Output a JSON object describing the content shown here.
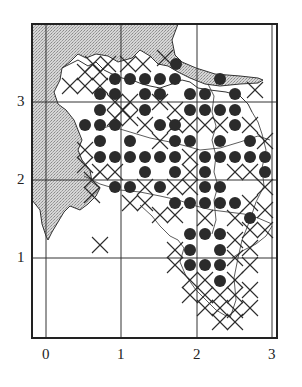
{
  "figure": {
    "type": "grid map with occurrence symbols",
    "x_axis": {
      "ticks": [
        "0",
        "1",
        "2",
        "3"
      ]
    },
    "y_axis": {
      "ticks": [
        "1",
        "2",
        "3"
      ]
    }
  },
  "legend_symbols": {
    "dot": "filled circle",
    "cross": "X mark",
    "shaded": "stippled grey area"
  },
  "colors": {
    "ink": "#2b2b2b",
    "shade": "#c8c8c8",
    "background": "#ffffff"
  },
  "dots": [
    [
      176,
      64
    ],
    [
      115,
      79
    ],
    [
      130,
      79
    ],
    [
      145,
      79
    ],
    [
      160,
      79
    ],
    [
      175,
      79
    ],
    [
      220,
      79
    ],
    [
      100,
      94
    ],
    [
      115,
      94
    ],
    [
      145,
      94
    ],
    [
      160,
      94
    ],
    [
      190,
      94
    ],
    [
      205,
      94
    ],
    [
      235,
      94
    ],
    [
      100,
      110
    ],
    [
      145,
      110
    ],
    [
      190,
      110
    ],
    [
      205,
      110
    ],
    [
      220,
      110
    ],
    [
      235,
      110
    ],
    [
      85,
      125
    ],
    [
      100,
      125
    ],
    [
      115,
      125
    ],
    [
      160,
      125
    ],
    [
      175,
      125
    ],
    [
      235,
      125
    ],
    [
      100,
      141
    ],
    [
      130,
      141
    ],
    [
      175,
      141
    ],
    [
      190,
      141
    ],
    [
      220,
      141
    ],
    [
      250,
      141
    ],
    [
      100,
      157
    ],
    [
      115,
      157
    ],
    [
      130,
      157
    ],
    [
      145,
      157
    ],
    [
      160,
      157
    ],
    [
      175,
      157
    ],
    [
      205,
      157
    ],
    [
      220,
      157
    ],
    [
      235,
      157
    ],
    [
      250,
      157
    ],
    [
      265,
      157
    ],
    [
      145,
      172
    ],
    [
      175,
      172
    ],
    [
      205,
      172
    ],
    [
      265,
      172
    ],
    [
      115,
      187
    ],
    [
      130,
      187
    ],
    [
      160,
      187
    ],
    [
      205,
      187
    ],
    [
      220,
      187
    ],
    [
      175,
      203
    ],
    [
      190,
      203
    ],
    [
      205,
      203
    ],
    [
      220,
      203
    ],
    [
      235,
      203
    ],
    [
      250,
      218
    ],
    [
      190,
      234
    ],
    [
      205,
      234
    ],
    [
      220,
      234
    ],
    [
      190,
      250
    ],
    [
      220,
      250
    ],
    [
      190,
      265
    ],
    [
      205,
      265
    ],
    [
      220,
      265
    ],
    [
      220,
      281
    ]
  ],
  "crosses": [
    [
      85,
      72
    ],
    [
      100,
      72
    ],
    [
      93,
      64
    ],
    [
      108,
      64
    ],
    [
      128,
      64
    ],
    [
      143,
      64
    ],
    [
      165,
      58
    ],
    [
      70,
      86
    ],
    [
      85,
      86
    ],
    [
      100,
      86
    ],
    [
      115,
      102
    ],
    [
      130,
      102
    ],
    [
      123,
      110
    ],
    [
      115,
      118
    ],
    [
      130,
      118
    ],
    [
      160,
      102
    ],
    [
      145,
      125
    ],
    [
      175,
      110
    ],
    [
      175,
      125
    ],
    [
      190,
      125
    ],
    [
      205,
      125
    ],
    [
      220,
      125
    ],
    [
      250,
      125
    ],
    [
      265,
      141
    ],
    [
      85,
      150
    ],
    [
      85,
      165
    ],
    [
      100,
      172
    ],
    [
      115,
      172
    ],
    [
      160,
      141
    ],
    [
      190,
      157
    ],
    [
      190,
      172
    ],
    [
      145,
      187
    ],
    [
      175,
      187
    ],
    [
      190,
      187
    ],
    [
      235,
      172
    ],
    [
      250,
      172
    ],
    [
      265,
      187
    ],
    [
      130,
      203
    ],
    [
      145,
      203
    ],
    [
      160,
      215
    ],
    [
      175,
      215
    ],
    [
      250,
      203
    ],
    [
      265,
      210
    ],
    [
      205,
      218
    ],
    [
      235,
      218
    ],
    [
      250,
      230
    ],
    [
      265,
      230
    ],
    [
      235,
      240
    ],
    [
      250,
      248
    ],
    [
      175,
      250
    ],
    [
      175,
      265
    ],
    [
      190,
      280
    ],
    [
      205,
      280
    ],
    [
      235,
      258
    ],
    [
      250,
      265
    ],
    [
      190,
      295
    ],
    [
      205,
      295
    ],
    [
      220,
      295
    ],
    [
      235,
      295
    ],
    [
      235,
      280
    ],
    [
      250,
      290
    ],
    [
      205,
      308
    ],
    [
      220,
      308
    ],
    [
      235,
      310
    ],
    [
      250,
      308
    ],
    [
      220,
      322
    ],
    [
      235,
      322
    ],
    [
      92,
      180
    ],
    [
      92,
      195
    ],
    [
      100,
      245
    ],
    [
      255,
      90
    ]
  ]
}
